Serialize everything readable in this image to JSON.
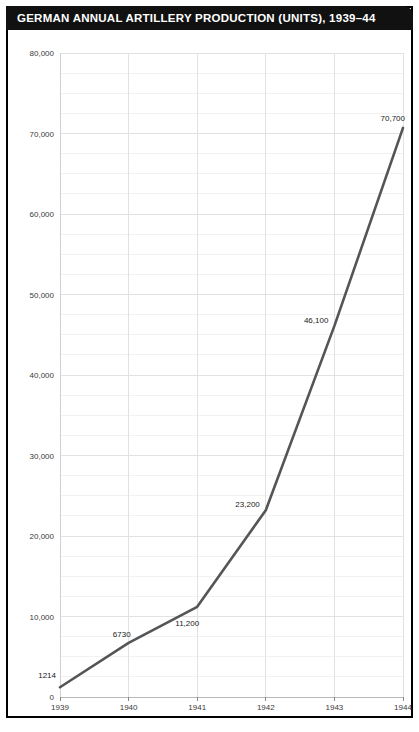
{
  "header": {
    "title": "GERMAN ANNUAL ARTILLERY PRODUCTION (UNITS), 1939–44",
    "background": "#111111",
    "text_color": "#ffffff"
  },
  "chart_data": {
    "type": "line",
    "title": "GERMAN ANNUAL ARTILLERY PRODUCTION (UNITS), 1939–44",
    "xlabel": "",
    "ylabel": "",
    "categories": [
      "1939",
      "1940",
      "1941",
      "1942",
      "1943",
      "1944"
    ],
    "x": [
      1939,
      1940,
      1941,
      1942,
      1943,
      1944
    ],
    "values": [
      1214,
      6730,
      11200,
      23200,
      46100,
      70700
    ],
    "point_labels": [
      "1214",
      "6730",
      "11,200",
      "23,200",
      "46,100",
      "70,700"
    ],
    "ylim": [
      0,
      80000
    ],
    "ytick_values": [
      0,
      10000,
      20000,
      30000,
      40000,
      50000,
      60000,
      70000,
      80000
    ],
    "ytick_labels": [
      "0",
      "10,000",
      "20,000",
      "30,000",
      "40,000",
      "50,000",
      "60,000",
      "70,000",
      "80,000"
    ],
    "xtick_labels": [
      "1939",
      "1940",
      "1941",
      "1942",
      "1943",
      "1944"
    ],
    "minor_y_step": 2500,
    "grid": {
      "horizontal": true,
      "vertical": true,
      "major_color": "#e2e2e2",
      "minor_color": "#f2f2f2"
    },
    "legend": null,
    "line_color": "#555555",
    "line_width": 2.6,
    "plot_background": "#ffffff"
  },
  "colors": {
    "frame": "#000000",
    "page_background": "#ffffff",
    "axis_text": "#3a3a3a",
    "label_text": "#1a1a1a"
  }
}
